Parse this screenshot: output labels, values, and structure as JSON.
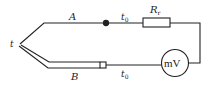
{
  "diagram": {
    "labels": {
      "wire_a": "A",
      "wire_b": "B",
      "hot_junction": "t",
      "cold_junction_top": "t",
      "cold_junction_top_sub": "0",
      "cold_junction_bottom": "t",
      "cold_junction_bottom_sub": "0",
      "resistor": "R",
      "resistor_sub": "r",
      "meter": "mV"
    },
    "colors": {
      "line": "#222222",
      "background": "#ffffff"
    }
  }
}
